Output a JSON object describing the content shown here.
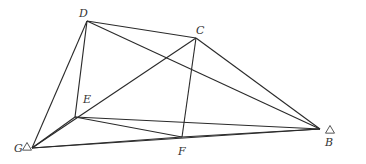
{
  "diagram": {
    "type": "geometric-figure",
    "stroke_color": "#2a2a2a",
    "points": [
      {
        "id": "D",
        "label": "D",
        "x": 87,
        "y": 21,
        "label_x": 79,
        "label_y": 17,
        "marker": null
      },
      {
        "id": "C",
        "label": "C",
        "x": 196,
        "y": 38,
        "label_x": 196,
        "label_y": 34,
        "marker": null
      },
      {
        "id": "E",
        "label": "E",
        "x": 75,
        "y": 117,
        "label_x": 83,
        "label_y": 103,
        "marker": null
      },
      {
        "id": "G",
        "label": "G",
        "x": 32,
        "y": 148,
        "label_x": 14,
        "label_y": 152,
        "marker": "triangle"
      },
      {
        "id": "F",
        "label": "F",
        "x": 182,
        "y": 137,
        "label_x": 178,
        "label_y": 155,
        "marker": null
      },
      {
        "id": "B",
        "label": "B",
        "x": 320,
        "y": 129,
        "label_x": 325,
        "label_y": 146,
        "marker": "triangle"
      }
    ],
    "edges": [
      [
        "D",
        "G"
      ],
      [
        "D",
        "E"
      ],
      [
        "D",
        "C"
      ],
      [
        "D",
        "B"
      ],
      [
        "C",
        "G"
      ],
      [
        "C",
        "F"
      ],
      [
        "C",
        "B"
      ],
      [
        "E",
        "B"
      ],
      [
        "E",
        "F"
      ],
      [
        "E",
        "G"
      ],
      [
        "G",
        "B"
      ],
      [
        "G",
        "F"
      ],
      [
        "F",
        "B"
      ]
    ],
    "triangle_markers": {
      "G": {
        "x": 27,
        "y": 147
      },
      "B": {
        "x": 330,
        "y": 130
      }
    }
  }
}
